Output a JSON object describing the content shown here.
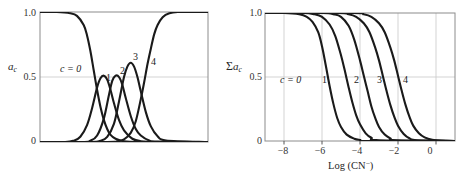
{
  "figure": {
    "panels": [
      {
        "id": "left",
        "ylabel": "a",
        "ylabel_sub": "c",
        "ylabel_prefix": "",
        "yticks": [
          "1.0",
          "0.5",
          "0"
        ],
        "xticks": [],
        "xlabel": "",
        "curve_labels": [
          "c = 0",
          "1",
          "2",
          "3",
          "4"
        ]
      },
      {
        "id": "right",
        "ylabel": "a",
        "ylabel_sub": "c",
        "ylabel_prefix": "Σ",
        "yticks": [
          "1.0",
          "0.5",
          "0"
        ],
        "xticks": [
          "−8",
          "−6",
          "−4",
          "−2",
          "0"
        ],
        "xlabel": "Log (CN",
        "xlabel_sup": "−",
        "xlabel_tail": ")",
        "curve_labels": [
          "c = 0",
          "1",
          "2",
          "3",
          "4"
        ]
      }
    ],
    "colors": {
      "curve": "#1a1a1a",
      "frame": "#8c8c8c",
      "grid": "#c8c8c8",
      "background": "#ffffff",
      "text": "#1a1a1a"
    }
  },
  "chart_data": [
    {
      "type": "line",
      "title": "",
      "panel": "left",
      "xlabel": "",
      "ylabel": "a_c",
      "xlim": [
        -9,
        1
      ],
      "ylim": [
        0,
        1.0
      ],
      "yticks": [
        0,
        0.5,
        1.0
      ],
      "xticks": [],
      "grid": "horizontal-only",
      "legend": "inline-curve-labels",
      "description": "Mole fraction a_c of each cyanide complex species versus log[CN-]; c=0 is free metal, c=4 fully complexed.",
      "series": [
        {
          "name": "c = 0",
          "label_position": {
            "x": -6.9,
            "y": 0.7
          },
          "x": [
            -9.0,
            -8.0,
            -7.2,
            -6.8,
            -6.4,
            -6.2,
            -6.0,
            -5.8,
            -5.6,
            -5.4,
            -5.2,
            -5.0,
            -4.8,
            -4.5,
            -4.0,
            -3.0,
            -2.0,
            -1.0,
            1.0
          ],
          "y": [
            1.0,
            1.0,
            0.99,
            0.97,
            0.9,
            0.82,
            0.7,
            0.55,
            0.4,
            0.27,
            0.17,
            0.1,
            0.055,
            0.025,
            0.006,
            0.0,
            0.0,
            0.0,
            0.0
          ]
        },
        {
          "name": "1",
          "label_position": {
            "x": -5.35,
            "y": 0.57
          },
          "x": [
            -9.0,
            -7.5,
            -7.0,
            -6.6,
            -6.2,
            -5.9,
            -5.6,
            -5.4,
            -5.2,
            -5.0,
            -4.8,
            -4.6,
            -4.3,
            -4.0,
            -3.5,
            -3.0,
            -2.0,
            1.0
          ],
          "y": [
            0.0,
            0.0,
            0.01,
            0.04,
            0.13,
            0.26,
            0.42,
            0.49,
            0.51,
            0.48,
            0.4,
            0.3,
            0.17,
            0.09,
            0.025,
            0.006,
            0.0,
            0.0
          ]
        },
        {
          "name": "2",
          "label_position": {
            "x": -4.75,
            "y": 0.6
          },
          "x": [
            -9.0,
            -6.5,
            -6.0,
            -5.6,
            -5.2,
            -4.9,
            -4.7,
            -4.5,
            -4.3,
            -4.1,
            -3.9,
            -3.6,
            -3.3,
            -3.0,
            -2.5,
            -2.0,
            1.0
          ],
          "y": [
            0.0,
            0.0,
            0.01,
            0.05,
            0.18,
            0.36,
            0.47,
            0.51,
            0.5,
            0.44,
            0.34,
            0.2,
            0.1,
            0.05,
            0.012,
            0.003,
            0.0
          ]
        },
        {
          "name": "3",
          "label_position": {
            "x": -4.05,
            "y": 0.78
          },
          "x": [
            -9.0,
            -6.0,
            -5.4,
            -5.0,
            -4.6,
            -4.3,
            -4.0,
            -3.8,
            -3.6,
            -3.4,
            -3.2,
            -3.0,
            -2.7,
            -2.4,
            -2.0,
            -1.5,
            1.0
          ],
          "y": [
            0.0,
            0.0,
            0.01,
            0.04,
            0.14,
            0.31,
            0.5,
            0.58,
            0.61,
            0.58,
            0.5,
            0.39,
            0.23,
            0.12,
            0.045,
            0.012,
            0.0
          ]
        },
        {
          "name": "4",
          "label_position": {
            "x": -3.35,
            "y": 0.76
          },
          "x": [
            -9.0,
            -5.0,
            -4.4,
            -4.0,
            -3.6,
            -3.3,
            -3.0,
            -2.8,
            -2.6,
            -2.4,
            -2.2,
            -2.0,
            -1.7,
            -1.3,
            -0.8,
            0.0,
            1.0
          ],
          "y": [
            0.0,
            0.0,
            0.005,
            0.02,
            0.07,
            0.16,
            0.33,
            0.46,
            0.6,
            0.72,
            0.83,
            0.9,
            0.96,
            0.99,
            1.0,
            1.0,
            1.0
          ]
        }
      ]
    },
    {
      "type": "line",
      "title": "",
      "panel": "right",
      "xlabel": "Log (CN−)",
      "ylabel": "Σa_c",
      "xlim": [
        -9,
        1
      ],
      "ylim": [
        0,
        1.0
      ],
      "yticks": [
        0,
        0.5,
        1.0
      ],
      "xticks": [
        -8,
        -6,
        -4,
        -2,
        0
      ],
      "grid": "both",
      "legend": "inline-curve-labels",
      "description": "Cumulative sum Σa_c of species fractions versus log[CN-]; five sigmoidal descending curves labelled c = 0 through 4.",
      "series": [
        {
          "name": "c = 0",
          "label_position": {
            "x": -7.3,
            "y": 0.5
          },
          "x": [
            -9.0,
            -8.0,
            -7.2,
            -6.8,
            -6.5,
            -6.2,
            -6.0,
            -5.8,
            -5.6,
            -5.4,
            -5.2,
            -5.0,
            -4.7,
            -4.3,
            -4.0,
            -3.5,
            1.0
          ],
          "y": [
            1.0,
            1.0,
            0.99,
            0.97,
            0.93,
            0.85,
            0.74,
            0.59,
            0.43,
            0.29,
            0.18,
            0.11,
            0.05,
            0.018,
            0.008,
            0.0,
            0.0
          ]
        },
        {
          "name": "1",
          "label_position": {
            "x": -6.1,
            "y": 0.5
          },
          "x": [
            -9.0,
            -7.0,
            -6.4,
            -6.0,
            -5.6,
            -5.3,
            -5.0,
            -4.8,
            -4.6,
            -4.4,
            -4.2,
            -4.0,
            -3.7,
            -3.4,
            -3.0,
            1.0
          ],
          "y": [
            1.0,
            1.0,
            0.99,
            0.97,
            0.91,
            0.82,
            0.67,
            0.55,
            0.42,
            0.3,
            0.2,
            0.13,
            0.06,
            0.025,
            0.006,
            0.0
          ]
        },
        {
          "name": "2",
          "label_position": {
            "x": -5.1,
            "y": 0.5
          },
          "x": [
            -9.0,
            -6.0,
            -5.4,
            -5.0,
            -4.6,
            -4.3,
            -4.0,
            -3.8,
            -3.6,
            -3.4,
            -3.2,
            -3.0,
            -2.7,
            -2.4,
            -2.1,
            1.0
          ],
          "y": [
            1.0,
            1.0,
            0.99,
            0.97,
            0.9,
            0.79,
            0.63,
            0.51,
            0.39,
            0.27,
            0.18,
            0.11,
            0.05,
            0.02,
            0.006,
            0.0
          ]
        },
        {
          "name": "3",
          "label_position": {
            "x": -4.5,
            "y": 0.5
          },
          "x": [
            -9.0,
            -5.2,
            -4.6,
            -4.2,
            -3.8,
            -3.5,
            -3.2,
            -3.0,
            -2.8,
            -2.6,
            -2.4,
            -2.2,
            -2.0,
            -1.7,
            -1.4,
            -1.0,
            1.0
          ],
          "y": [
            1.0,
            1.0,
            0.99,
            0.97,
            0.92,
            0.85,
            0.73,
            0.63,
            0.51,
            0.39,
            0.28,
            0.19,
            0.12,
            0.055,
            0.022,
            0.006,
            0.0
          ]
        },
        {
          "name": "4",
          "label_position": {
            "x": -3.8,
            "y": 0.5
          },
          "x": [
            -9.0,
            -4.4,
            -3.8,
            -3.4,
            -3.0,
            -2.7,
            -2.4,
            -2.2,
            -2.0,
            -1.8,
            -1.6,
            -1.4,
            -1.2,
            -0.9,
            -0.6,
            -0.2,
            0.3,
            1.0
          ],
          "y": [
            1.0,
            1.0,
            0.99,
            0.97,
            0.92,
            0.85,
            0.73,
            0.63,
            0.51,
            0.39,
            0.28,
            0.19,
            0.12,
            0.06,
            0.028,
            0.009,
            0.002,
            0.0
          ]
        }
      ]
    }
  ]
}
